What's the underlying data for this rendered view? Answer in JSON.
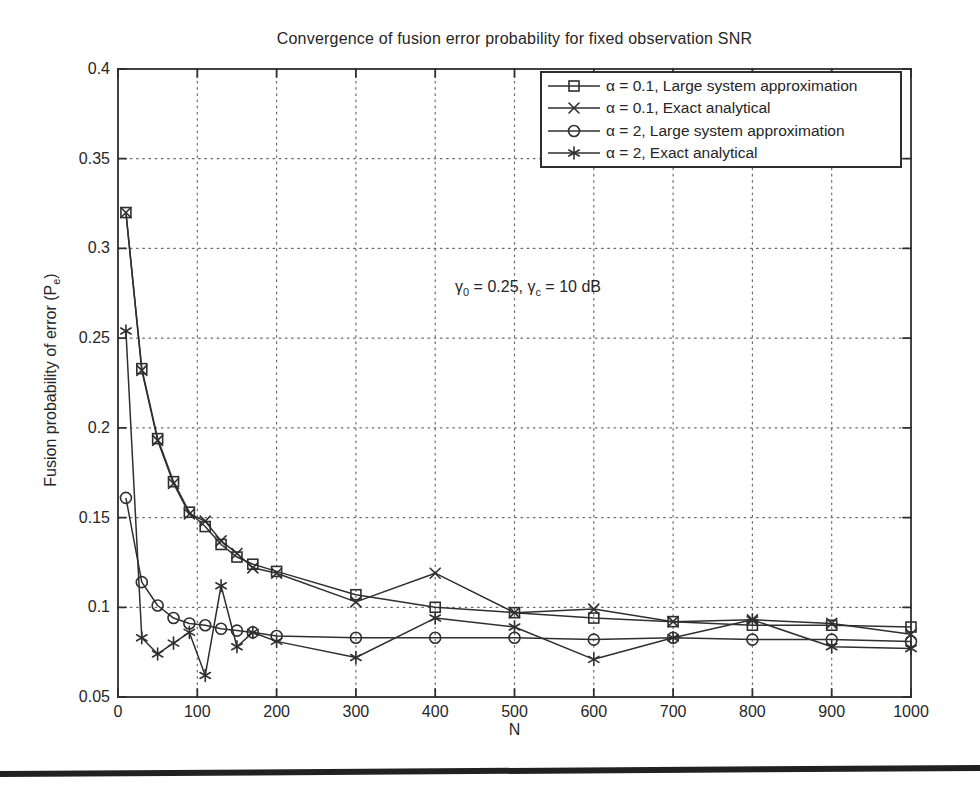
{
  "chart_data": {
    "type": "line",
    "title": "Convergence of fusion error probability for fixed observation SNR",
    "xlabel": "N",
    "ylabel": "Fusion probability of error (Pe)",
    "ylabel_parts": {
      "main": "Fusion probability of error (P",
      "sub": "e",
      "close": ")"
    },
    "annotation": {
      "gamma1": "γ",
      "gamma1_sub": "0",
      "text1": " = 0.25, ",
      "gamma2": "γ",
      "gamma2_sub": "c",
      "text2": " = 10 dB"
    },
    "xlim": [
      0,
      1000
    ],
    "ylim": [
      0.05,
      0.4
    ],
    "x_ticks": [
      0,
      100,
      200,
      300,
      400,
      500,
      600,
      700,
      800,
      900,
      1000
    ],
    "x_tick_labels": [
      "0",
      "100",
      "200",
      "300",
      "400",
      "500",
      "600",
      "700",
      "800",
      "900",
      "1000"
    ],
    "y_ticks": [
      0.05,
      0.1,
      0.15,
      0.2,
      0.25,
      0.3,
      0.35,
      0.4
    ],
    "y_tick_labels": [
      "0.05",
      "0.1",
      "0.15",
      "0.2",
      "0.25",
      "0.3",
      "0.35",
      "0.4"
    ],
    "grid": true,
    "legend_position": "top-right",
    "line_color": "#2f2f2f",
    "grid_color": "#6a6a6a",
    "x": [
      10,
      30,
      50,
      70,
      90,
      110,
      130,
      150,
      170,
      200,
      300,
      400,
      500,
      600,
      700,
      800,
      900,
      1000
    ],
    "series": [
      {
        "name": "alpha-0.1-large-system",
        "label": "α = 0.1, Large system approximation",
        "marker": "square",
        "values": [
          0.32,
          0.233,
          0.194,
          0.17,
          0.153,
          0.145,
          0.135,
          0.128,
          0.124,
          0.12,
          0.107,
          0.1,
          0.097,
          0.094,
          0.092,
          0.09,
          0.09,
          0.089
        ]
      },
      {
        "name": "alpha-0.1-exact",
        "label": "α = 0.1, Exact analytical",
        "marker": "x",
        "values": [
          0.32,
          0.232,
          0.193,
          0.169,
          0.152,
          0.148,
          0.137,
          0.13,
          0.122,
          0.119,
          0.103,
          0.119,
          0.097,
          0.099,
          0.092,
          0.093,
          0.091,
          0.085
        ]
      },
      {
        "name": "alpha-2-large-system",
        "label": "α = 2, Large system approximation",
        "marker": "circle",
        "values": [
          0.161,
          0.114,
          0.101,
          0.094,
          0.091,
          0.09,
          0.088,
          0.087,
          0.086,
          0.084,
          0.083,
          0.083,
          0.083,
          0.082,
          0.083,
          0.082,
          0.082,
          0.081
        ]
      },
      {
        "name": "alpha-2-exact",
        "label": "α = 2, Exact analytical",
        "marker": "asterisk",
        "values": [
          0.254,
          0.083,
          0.074,
          0.08,
          0.086,
          0.062,
          0.112,
          0.078,
          0.086,
          0.081,
          0.072,
          0.094,
          0.089,
          0.071,
          0.083,
          0.093,
          0.078,
          0.077
        ]
      }
    ]
  }
}
